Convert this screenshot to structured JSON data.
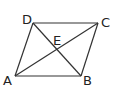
{
  "diagram": {
    "type": "parallelogram with diagonals",
    "stroke_color": "#333333",
    "points": {
      "A": {
        "x": 15,
        "y": 76
      },
      "B": {
        "x": 81,
        "y": 76
      },
      "C": {
        "x": 98,
        "y": 23
      },
      "D": {
        "x": 33,
        "y": 23
      },
      "E": {
        "x": 56,
        "y": 49
      }
    },
    "labels": {
      "A": "A",
      "B": "B",
      "C": "C",
      "D": "D",
      "E": "E"
    },
    "segments": [
      "AB",
      "BC",
      "CD",
      "DA",
      "AC",
      "BD"
    ]
  }
}
